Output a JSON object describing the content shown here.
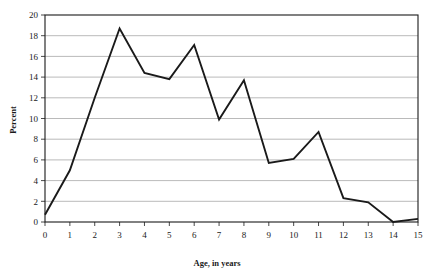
{
  "chart_data": {
    "type": "line",
    "title": "",
    "xlabel": "Age, in years",
    "ylabel": "Percent",
    "x": [
      0,
      1,
      2,
      3,
      4,
      5,
      6,
      7,
      8,
      9,
      10,
      11,
      12,
      13,
      14,
      15
    ],
    "values": [
      0.7,
      5.0,
      12.0,
      18.7,
      14.4,
      13.8,
      17.1,
      9.9,
      13.7,
      5.7,
      6.1,
      8.7,
      2.3,
      1.9,
      0.0,
      0.3
    ],
    "series": [
      {
        "name": "Percent",
        "values": [
          0.7,
          5.0,
          12.0,
          18.7,
          14.4,
          13.8,
          17.1,
          9.9,
          13.7,
          5.7,
          6.1,
          8.7,
          2.3,
          1.9,
          0.0,
          0.3
        ]
      }
    ],
    "xlim": [
      0,
      15
    ],
    "ylim": [
      0,
      20
    ],
    "xticks": [
      0,
      1,
      2,
      3,
      4,
      5,
      6,
      7,
      8,
      9,
      10,
      11,
      12,
      13,
      14,
      15
    ],
    "yticks": [
      0,
      2,
      4,
      6,
      8,
      10,
      12,
      14,
      16,
      18,
      20
    ],
    "xtick_labels": [
      "0",
      "1",
      "2",
      "3",
      "4",
      "5",
      "6",
      "7",
      "8",
      "9",
      "10",
      "11",
      "12",
      "13",
      "14",
      "15"
    ],
    "ytick_labels": [
      "0",
      "2",
      "4",
      "6",
      "8",
      "10",
      "12",
      "14",
      "16",
      "18",
      "20"
    ],
    "grid": "horizontal",
    "legend": "none",
    "line_color": "#1a1a1a",
    "grid_color": "#a8a8a8",
    "frame_color": "#1a1a1a",
    "background_color": "#ffffff",
    "markers": false,
    "annotations": []
  }
}
